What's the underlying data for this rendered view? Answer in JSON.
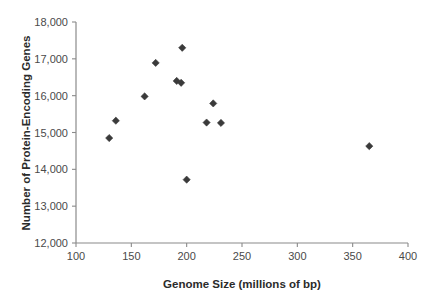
{
  "chart_data": {
    "type": "scatter",
    "title": "",
    "xlabel": "Genome Size (millions of bp)",
    "ylabel": "Number of Protein-Encoding Genes",
    "xlim": [
      100,
      400
    ],
    "ylim": [
      12000,
      18000
    ],
    "xticks": [
      100,
      150,
      200,
      250,
      300,
      350,
      400
    ],
    "xtick_labels": [
      "100",
      "150",
      "200",
      "250",
      "300",
      "350",
      "400"
    ],
    "yticks": [
      12000,
      13000,
      14000,
      15000,
      16000,
      17000,
      18000
    ],
    "ytick_labels": [
      "12,000",
      "13,000",
      "14,000",
      "15,000",
      "16,000",
      "17,000",
      "18,000"
    ],
    "grid": false,
    "legend": null,
    "marker_shape": "diamond",
    "marker_color": "#3a3a3a",
    "points": [
      {
        "x": 130,
        "y": 14850
      },
      {
        "x": 136,
        "y": 15320
      },
      {
        "x": 162,
        "y": 15980
      },
      {
        "x": 172,
        "y": 16890
      },
      {
        "x": 191,
        "y": 16400
      },
      {
        "x": 195,
        "y": 16350
      },
      {
        "x": 196,
        "y": 17300
      },
      {
        "x": 200,
        "y": 13720
      },
      {
        "x": 218,
        "y": 15270
      },
      {
        "x": 224,
        "y": 15790
      },
      {
        "x": 231,
        "y": 15260
      },
      {
        "x": 365,
        "y": 14630
      }
    ]
  }
}
